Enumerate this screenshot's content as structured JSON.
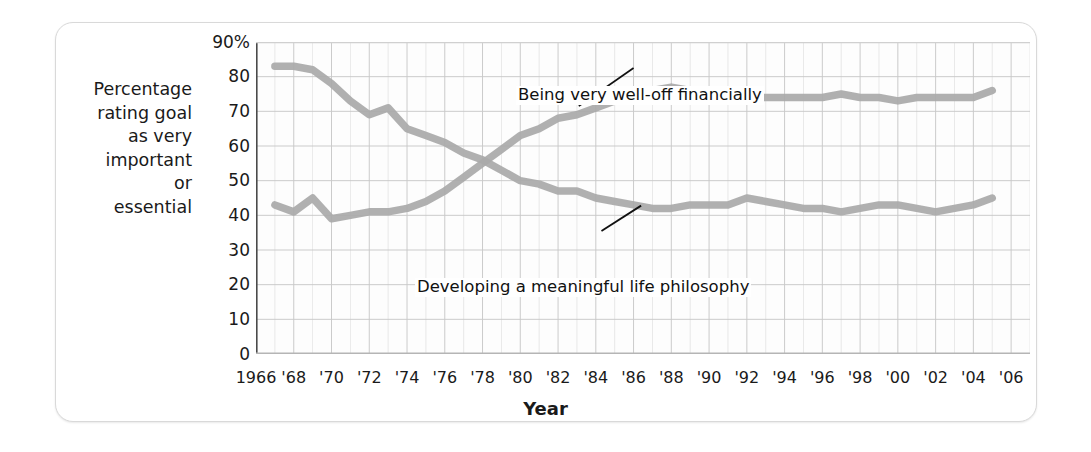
{
  "axes": {
    "y_caption_lines": [
      "Percentage",
      "rating goal",
      "as very",
      "important",
      "or",
      "essential"
    ],
    "x_title": "Year",
    "y_ticks": [
      "90%",
      "80",
      "70",
      "60",
      "50",
      "40",
      "30",
      "20",
      "10",
      "0"
    ],
    "x_ticks": [
      "1966",
      "'68",
      "'70",
      "'72",
      "'74",
      "'76",
      "'78",
      "'80",
      "'82",
      "'84",
      "'86",
      "'88",
      "'90",
      "'92",
      "'94",
      "'96",
      "'98",
      "'00",
      "'02",
      "'04",
      "'06"
    ]
  },
  "annotations": {
    "wealth_label": "Being very well-off financially",
    "philosophy_label": "Developing a meaningful life philosophy"
  },
  "style": {
    "line_color": "#a9a9a9",
    "grid_color": "#c9c9c9",
    "axis_color": "#4a4a4a",
    "text_color": "#1a1a1a"
  },
  "chart_data": {
    "type": "line",
    "title": "",
    "xlabel": "Year",
    "ylabel": "Percentage rating goal as very important or essential",
    "xlim": [
      1966,
      2007
    ],
    "ylim": [
      0,
      90
    ],
    "grid": true,
    "legend": "inline-annotations",
    "x": [
      1967,
      1968,
      1969,
      1970,
      1971,
      1972,
      1973,
      1974,
      1975,
      1976,
      1977,
      1978,
      1979,
      1980,
      1981,
      1982,
      1983,
      1984,
      1985,
      1986,
      1987,
      1988,
      1989,
      1990,
      1991,
      1992,
      1993,
      1994,
      1995,
      1996,
      1997,
      1998,
      1999,
      2000,
      2001,
      2002,
      2003,
      2004,
      2005
    ],
    "series": [
      {
        "name": "Developing a meaningful life philosophy",
        "values": [
          83,
          83,
          82,
          78,
          73,
          69,
          71,
          65,
          63,
          61,
          58,
          56,
          53,
          50,
          49,
          47,
          47,
          45,
          44,
          43,
          42,
          42,
          43,
          43,
          43,
          45,
          44,
          43,
          42,
          42,
          41,
          42,
          43,
          43,
          42,
          41,
          42,
          43,
          45
        ]
      },
      {
        "name": "Being very well-off financially",
        "values": [
          43,
          41,
          45,
          39,
          40,
          41,
          41,
          42,
          44,
          47,
          51,
          55,
          59,
          63,
          65,
          68,
          69,
          71,
          73,
          75,
          76,
          77,
          76,
          75,
          74,
          74,
          74,
          74,
          74,
          74,
          75,
          74,
          74,
          73,
          74,
          74,
          74,
          74,
          76
        ]
      }
    ]
  }
}
